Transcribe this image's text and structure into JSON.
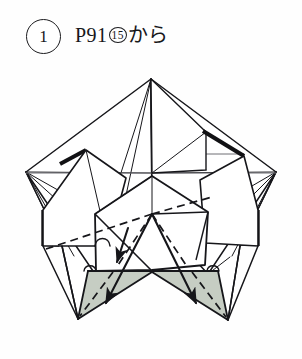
{
  "page": {
    "background_color": "#fefefe",
    "width": 302,
    "height": 359
  },
  "header": {
    "step_number": "1",
    "caption_prefix": "P91",
    "caption_reference": "15",
    "caption_suffix": "から",
    "caption_full": "P91⑮から"
  },
  "figure": {
    "colors": {
      "paper_front": "#ffffff",
      "paper_shaded": "#c6cdc3",
      "line": "#16161a",
      "thick_edge": "#111114",
      "fold_dashed": "#16161a",
      "light_line": "#6f6f74"
    },
    "geometry": {
      "apex": [
        151,
        19
      ],
      "left_vertex": [
        26,
        112
      ],
      "right_vertex": [
        276,
        112
      ],
      "bottom_left_point": [
        78,
        259
      ],
      "bottom_right_point": [
        228,
        260
      ],
      "center_hub": [
        152,
        154
      ],
      "center_notch": [
        152,
        210
      ]
    },
    "annotations": [
      {
        "name": "fold-arrow-left",
        "type": "valley-fold-arrow",
        "from": [
          152,
          154
        ],
        "to": [
          106,
          246
        ],
        "direction": "down-left"
      },
      {
        "name": "fold-arrow-right",
        "type": "valley-fold-arrow",
        "from": [
          152,
          154
        ],
        "to": [
          196,
          246
        ],
        "direction": "down-right"
      },
      {
        "name": "fold-arrow-inner-left",
        "type": "short-fold-arrow",
        "from": [
          130,
          170
        ],
        "to": [
          116,
          200
        ],
        "direction": "down"
      }
    ]
  }
}
